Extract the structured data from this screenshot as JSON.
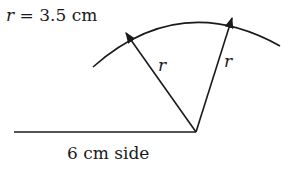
{
  "diagram": {
    "radius_label": "r = 3.5 cm",
    "radius_label_var": "r",
    "radius_label_rest": " = 3.5 cm",
    "left_radius_label": "r",
    "right_radius_label": "r",
    "base_label": "6 cm side"
  },
  "colors": {
    "stroke": "#1a1a1a",
    "background": "#ffffff"
  }
}
